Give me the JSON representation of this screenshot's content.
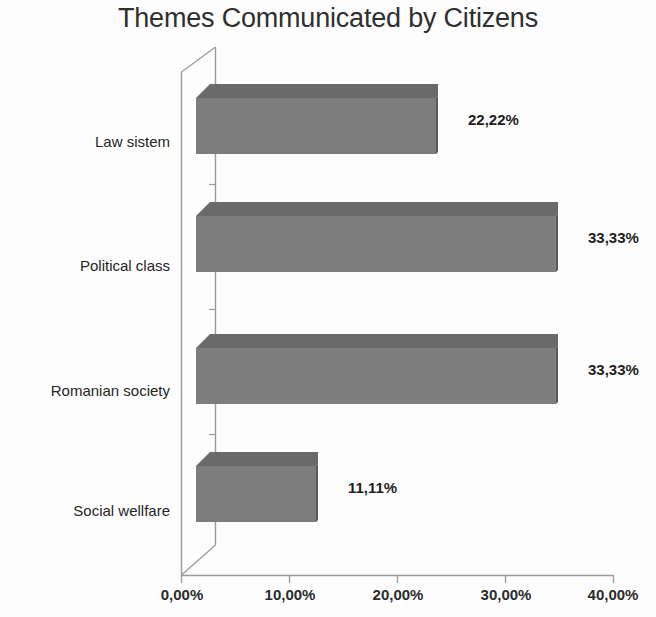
{
  "chart_data": {
    "type": "bar",
    "orientation": "horizontal",
    "style": "3d",
    "title": "Themes Communicated by Citizens",
    "xlabel": "",
    "ylabel": "",
    "categories": [
      "Law sistem",
      "Political class",
      "Romanian society",
      "Social wellfare"
    ],
    "values": [
      22.22,
      33.33,
      33.33,
      11.11
    ],
    "value_labels": [
      "22,22%",
      "33,33%",
      "33,33%",
      "11,11%"
    ],
    "xlim": [
      0,
      40
    ],
    "xticks": [
      0,
      10,
      20,
      30,
      40
    ],
    "xtick_labels": [
      "0,00%",
      "10,00%",
      "20,00%",
      "30,00%",
      "40,00%"
    ],
    "grid": false,
    "legend": null,
    "decimal_separator": ",",
    "unit": "%",
    "colors": {
      "bar_front": "#7d7d7d",
      "bar_top": "#6a6a6a",
      "bar_side": "#595959",
      "axis_line": "#9a9a9a",
      "title_text": "#2f2f2f",
      "label_text": "#262626",
      "background": "#fdfdfd"
    }
  }
}
